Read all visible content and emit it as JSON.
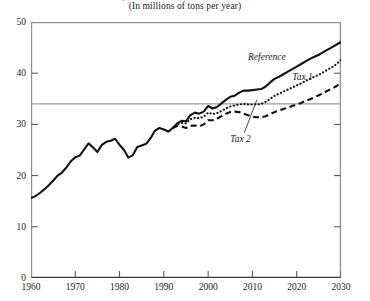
{
  "chart_data": {
    "type": "line",
    "title": "Projected Emissions of Carbon Dioxide",
    "subtitle": "(In millions of tons per year)",
    "xlabel": "",
    "ylabel": "",
    "xlim": [
      1960,
      2030
    ],
    "ylim": [
      0,
      50
    ],
    "xticks": [
      1960,
      1970,
      1980,
      1990,
      2000,
      2010,
      2020,
      2030
    ],
    "yticks": [
      0,
      10,
      20,
      30,
      40,
      50
    ],
    "grid": false,
    "legend_position": "inline-annotations",
    "reference_line": {
      "label": "1990 level",
      "value": 34,
      "orientation": "horizontal"
    },
    "series": [
      {
        "name": "Reference",
        "style": "solid",
        "x": [
          1960,
          1961,
          1962,
          1963,
          1964,
          1965,
          1966,
          1967,
          1968,
          1969,
          1970,
          1971,
          1972,
          1973,
          1974,
          1975,
          1976,
          1977,
          1978,
          1979,
          1980,
          1981,
          1982,
          1983,
          1984,
          1985,
          1986,
          1987,
          1988,
          1989,
          1990,
          1991,
          1992,
          1993,
          1994,
          1995,
          1996,
          1997,
          1998,
          1999,
          2000,
          2001,
          2002,
          2003,
          2004,
          2005,
          2006,
          2007,
          2008,
          2009,
          2010,
          2011,
          2012,
          2013,
          2014,
          2015,
          2016,
          2017,
          2018,
          2019,
          2020,
          2021,
          2022,
          2023,
          2024,
          2025,
          2026,
          2027,
          2028,
          2029,
          2030
        ],
        "values": [
          15.6,
          16.0,
          16.6,
          17.3,
          18.1,
          19.0,
          20.0,
          20.6,
          21.6,
          22.8,
          23.6,
          23.9,
          25.1,
          26.3,
          25.5,
          24.6,
          26.0,
          26.6,
          26.8,
          27.2,
          26.0,
          25.0,
          23.5,
          24.0,
          25.6,
          25.9,
          26.2,
          27.3,
          28.8,
          29.3,
          29.0,
          28.6,
          29.3,
          30.2,
          30.7,
          30.6,
          31.8,
          32.3,
          32.1,
          32.5,
          33.6,
          33.1,
          33.4,
          34.1,
          34.8,
          35.4,
          35.6,
          36.2,
          36.6,
          36.6,
          36.7,
          36.8,
          36.9,
          37.4,
          38.2,
          38.9,
          39.3,
          39.8,
          40.3,
          40.8,
          41.3,
          41.8,
          42.3,
          42.8,
          43.2,
          43.6,
          44.1,
          44.6,
          45.1,
          45.6,
          46.1
        ]
      },
      {
        "name": "Tax 1",
        "style": "dotted",
        "x": [
          1992,
          1993,
          1994,
          1995,
          1996,
          1997,
          1998,
          1999,
          2000,
          2001,
          2002,
          2003,
          2004,
          2005,
          2006,
          2007,
          2008,
          2009,
          2010,
          2011,
          2012,
          2013,
          2014,
          2015,
          2016,
          2017,
          2018,
          2019,
          2020,
          2021,
          2022,
          2023,
          2024,
          2025,
          2026,
          2027,
          2028,
          2029,
          2030
        ],
        "values": [
          29.3,
          30.0,
          30.3,
          30.2,
          31.0,
          31.3,
          31.2,
          31.5,
          32.3,
          32.0,
          32.2,
          32.6,
          33.1,
          33.5,
          33.7,
          33.9,
          34.0,
          33.9,
          33.9,
          33.9,
          34.0,
          34.4,
          35.0,
          35.6,
          36.0,
          36.4,
          36.8,
          37.2,
          37.6,
          38.0,
          38.5,
          38.9,
          39.3,
          39.7,
          40.2,
          40.7,
          41.2,
          41.8,
          42.6
        ]
      },
      {
        "name": "Tax 2",
        "style": "dashed",
        "x": [
          1992,
          1993,
          1994,
          1995,
          1996,
          1997,
          1998,
          1999,
          2000,
          2001,
          2002,
          2003,
          2004,
          2005,
          2006,
          2007,
          2008,
          2009,
          2010,
          2011,
          2012,
          2013,
          2014,
          2015,
          2016,
          2017,
          2018,
          2019,
          2020,
          2021,
          2022,
          2023,
          2024,
          2025,
          2026,
          2027,
          2028,
          2029,
          2030
        ],
        "values": [
          29.3,
          29.7,
          29.6,
          29.3,
          29.7,
          29.8,
          29.6,
          30.0,
          30.8,
          30.8,
          31.1,
          31.6,
          32.1,
          32.4,
          32.5,
          32.4,
          32.1,
          31.8,
          31.5,
          31.4,
          31.4,
          31.6,
          32.0,
          32.4,
          32.7,
          33.0,
          33.3,
          33.6,
          33.9,
          34.2,
          34.6,
          34.9,
          35.3,
          35.7,
          36.1,
          36.6,
          37.0,
          37.5,
          38.1
        ]
      }
    ],
    "annotations": [
      {
        "text": "Reference",
        "x": 2009,
        "y": 43.0
      },
      {
        "text": "Tax 1",
        "x": 2019,
        "y": 39.0
      },
      {
        "text": "Tax 2",
        "x": 2005,
        "y": 27.0,
        "leader_to_x": 2011,
        "leader_to_y": 34.8
      }
    ]
  }
}
